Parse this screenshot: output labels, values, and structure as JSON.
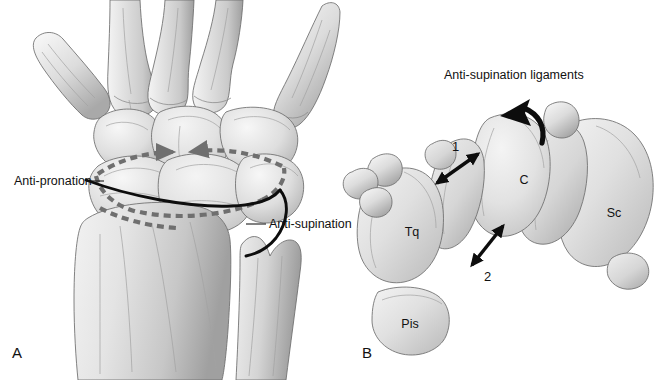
{
  "figure": {
    "background_color": "#ffffff",
    "ink_color": "#111111",
    "bone_fill_light": "#e9e9e9",
    "bone_fill_mid": "#d2d2d2",
    "bone_fill_dark": "#b4b4b4",
    "bone_outline_color": "#6d6d6d",
    "solid_ligament_color": "#0d0d0d",
    "dashed_ligament_color": "#6f6f6f"
  },
  "panel_a": {
    "letter": "A",
    "view": "Posteroanterior view of wrist",
    "callouts": [
      {
        "id": "anti-pronation",
        "label": "Anti-pronation",
        "line_style": "dashed"
      },
      {
        "id": "anti-supination",
        "label": "Anti-supination",
        "line_style": "solid"
      }
    ],
    "bones": [
      {
        "id": "metacarpal-1",
        "label": ""
      },
      {
        "id": "metacarpal-2",
        "label": ""
      },
      {
        "id": "metacarpal-3",
        "label": ""
      },
      {
        "id": "metacarpal-4",
        "label": ""
      },
      {
        "id": "metacarpal-5",
        "label": ""
      },
      {
        "id": "radius",
        "label": ""
      },
      {
        "id": "ulna",
        "label": ""
      }
    ]
  },
  "panel_b": {
    "letter": "B",
    "heading": "Anti-supination ligaments",
    "markers": [
      {
        "id": "ligament-1",
        "label": "1",
        "arrow": "double-headed"
      },
      {
        "id": "ligament-2",
        "label": "2",
        "arrow": "double-headed"
      }
    ],
    "rotation_arrow": {
      "id": "supination-rotation-arrow",
      "direction": "counter-clockwise"
    },
    "bones": [
      {
        "id": "triquetrum",
        "label": "Tq"
      },
      {
        "id": "capitate",
        "label": "C"
      },
      {
        "id": "scaphoid",
        "label": "Sc"
      },
      {
        "id": "pisiform",
        "label": "Pis"
      }
    ]
  }
}
